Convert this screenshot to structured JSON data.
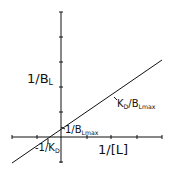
{
  "diagram": {
    "type": "double-reciprocal (Lineweaver-Burk) plot",
    "colors": {
      "line": "#111111",
      "background": "#ffffff"
    },
    "y_axis": {
      "label_main": "1/B",
      "label_sub": "L"
    },
    "x_axis": {
      "label": "1/[L]"
    },
    "annotations": {
      "slope": {
        "main": "K",
        "sub1": "D",
        "mid": "/B",
        "sub2": "Lmax"
      },
      "y_intercept": {
        "main": "1/B",
        "sub": "Lmax"
      },
      "x_intercept": {
        "main": "-1/K",
        "sub": "D"
      }
    }
  }
}
